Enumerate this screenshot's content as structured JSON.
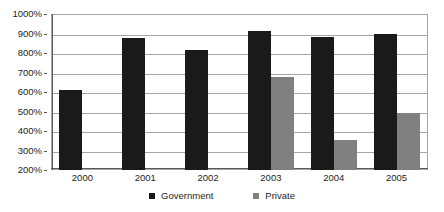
{
  "chart_data": {
    "type": "bar",
    "title": "",
    "subtitle": "",
    "xlabel": "",
    "ylabel": "",
    "categories": [
      "2000",
      "2001",
      "2002",
      "2003",
      "2004",
      "2005"
    ],
    "series": [
      {
        "name": "Government",
        "color": "#1a1a1a",
        "values": [
          610,
          875,
          815,
          915,
          880,
          900
        ]
      },
      {
        "name": "Private",
        "color": "#808080",
        "values": [
          null,
          null,
          null,
          675,
          355,
          490
        ]
      }
    ],
    "ylim": [
      200,
      1000
    ],
    "ytick_values": [
      200,
      300,
      400,
      500,
      600,
      700,
      800,
      900,
      1000
    ],
    "ytick_labels": [
      "200%",
      "300%",
      "400%",
      "500%",
      "600%",
      "700%",
      "800%",
      "900%",
      "1000%"
    ],
    "value_suffix": "%",
    "grid": true,
    "grid_axis": "y",
    "legend_position": "bottom",
    "legend_entries": [
      {
        "label": "Government",
        "color": "#1a1a1a",
        "marker": "square"
      },
      {
        "label": "Private",
        "color": "#808080",
        "marker": "square"
      }
    ],
    "plot_background": "#ffffff",
    "border_color": "#a6a6a6"
  }
}
